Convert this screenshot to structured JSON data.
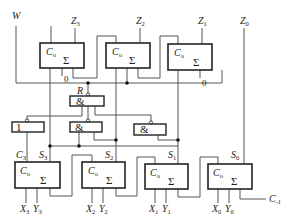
{
  "diagram": {
    "type": "digital-logic-circuit",
    "top_inputs": {
      "w": {
        "label": "W"
      },
      "z3": {
        "label": "Z",
        "sub": "3"
      },
      "z2": {
        "label": "Z",
        "sub": "2"
      },
      "z1": {
        "label": "Z",
        "sub": "1"
      },
      "z0": {
        "label": "Z",
        "sub": "0"
      }
    },
    "top_adders": [
      {
        "carry_label": "C",
        "carry_sub": "o",
        "sum_symbol": "Σ",
        "zero_label": "0"
      },
      {
        "carry_label": "C",
        "carry_sub": "o",
        "sum_symbol": "Σ"
      },
      {
        "carry_label": "C",
        "carry_sub": "o",
        "sum_symbol": "Σ",
        "zero_label": "0"
      }
    ],
    "gates": {
      "and_r": {
        "symbol": "&",
        "input_label": "R"
      },
      "or_1": {
        "symbol": "1"
      },
      "and_2": {
        "symbol": "&"
      },
      "and_3": {
        "symbol": "&"
      }
    },
    "bottom_adders": [
      {
        "carry_label": "C",
        "carry_sub": "o",
        "sum_symbol": "Σ",
        "top_left": {
          "label": "C",
          "sub": "3"
        },
        "top_right": {
          "label": "S",
          "sub": "3"
        },
        "inputs": [
          {
            "label": "X",
            "sub": "3"
          },
          {
            "label": "Y",
            "sub": "3"
          }
        ]
      },
      {
        "carry_label": "C",
        "carry_sub": "o",
        "sum_symbol": "Σ",
        "top_right": {
          "label": "S",
          "sub": "2"
        },
        "inputs": [
          {
            "label": "X",
            "sub": "2"
          },
          {
            "label": "Y",
            "sub": "2"
          }
        ]
      },
      {
        "carry_label": "C",
        "carry_sub": "o",
        "sum_symbol": "Σ",
        "top_right": {
          "label": "S",
          "sub": "1"
        },
        "inputs": [
          {
            "label": "X",
            "sub": "1"
          },
          {
            "label": "Y",
            "sub": "1"
          }
        ]
      },
      {
        "carry_label": "C",
        "carry_sub": "o",
        "sum_symbol": "Σ",
        "top_right": {
          "label": "S",
          "sub": "0"
        },
        "inputs": [
          {
            "label": "X",
            "sub": "0"
          },
          {
            "label": "Y",
            "sub": "0"
          }
        ],
        "carry_in": {
          "label": "C",
          "sub": "-1"
        }
      }
    ]
  }
}
